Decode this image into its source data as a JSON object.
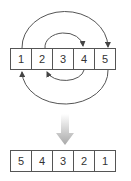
{
  "diagram": {
    "type": "array-reversal",
    "before": {
      "cells": [
        "1",
        "2",
        "3",
        "4",
        "5"
      ]
    },
    "after": {
      "cells": [
        "5",
        "4",
        "3",
        "2",
        "1"
      ]
    },
    "swaps": [
      {
        "from": "1",
        "to": "5",
        "direction": "over-top"
      },
      {
        "from": "5",
        "to": "1",
        "direction": "under-bottom"
      },
      {
        "from": "2",
        "to": "4",
        "direction": "over-top"
      },
      {
        "from": "4",
        "to": "2",
        "direction": "under-bottom"
      }
    ],
    "colors": {
      "border": "#555555",
      "arrow": "#444444",
      "transition_arrow": "#b0b0b0"
    }
  }
}
